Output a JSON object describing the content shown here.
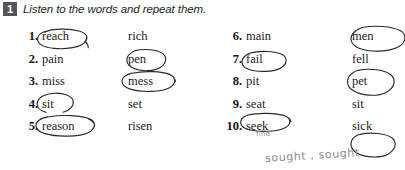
{
  "exercise": {
    "number": "1",
    "instruction": "Listen to the words and repeat them."
  },
  "columns": {
    "left": [
      {
        "num": "1.",
        "word_a": "reach",
        "word_b": "rich",
        "circled": "a"
      },
      {
        "num": "2.",
        "word_a": "pain",
        "word_b": "pen",
        "circled": "b"
      },
      {
        "num": "3.",
        "word_a": "miss",
        "word_b": "mess",
        "circled": "b"
      },
      {
        "num": "4.",
        "word_a": "sit",
        "word_b": "set",
        "circled": "a"
      },
      {
        "num": "5.",
        "word_a": "reason",
        "word_b": "risen",
        "circled": "a"
      }
    ],
    "right": [
      {
        "num": "6.",
        "word_a": "main",
        "word_b": "men",
        "circled": "b"
      },
      {
        "num": "7.",
        "word_a": "fail",
        "word_b": "fell",
        "circled": "a"
      },
      {
        "num": "8.",
        "word_a": "pit",
        "word_b": "pet",
        "circled": "b"
      },
      {
        "num": "9.",
        "word_a": "seat",
        "word_b": "sit",
        "circled": "a"
      },
      {
        "num": "10.",
        "word_a": "seek",
        "word_b": "sick",
        "circled": "b"
      }
    ]
  },
  "annotations": {
    "find": "find",
    "sought": "sought , sought"
  },
  "colors": {
    "badge_background": "#55565a",
    "badge_text": "#ffffff",
    "ink": "#1a1a1a",
    "pen_circle": "#2b2b2b",
    "pencil": "#8d8d8d"
  }
}
